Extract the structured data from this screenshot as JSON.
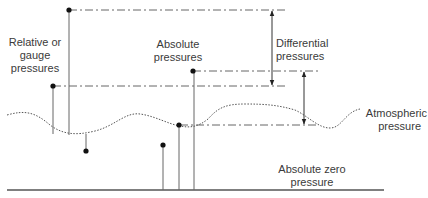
{
  "labels": {
    "relative": {
      "line1": "Relative or",
      "line2": "gauge",
      "line3": "pressures"
    },
    "absolute": {
      "line1": "Absolute",
      "line2": "pressures"
    },
    "differential": {
      "line1": "Differential",
      "line2": "pressures"
    },
    "atmospheric": {
      "line1": "Atmospheric",
      "line2": "pressure"
    },
    "absolute_zero": {
      "line1": "Absolute zero",
      "line2": "pressure"
    }
  },
  "colors": {
    "line": "#555555",
    "dot": "#111111",
    "text": "#3a3a3a"
  }
}
